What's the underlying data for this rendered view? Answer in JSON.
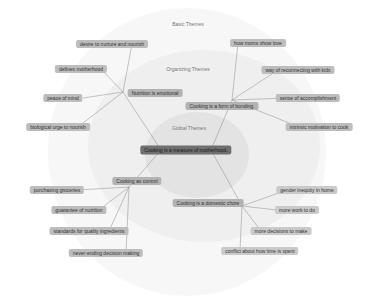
{
  "rings": {
    "basic_label": "Basic Themes",
    "organizing_label": "Organizing Themes",
    "global_label": "Global Themes"
  },
  "global_theme": {
    "label": "Cooking is a measure of motherhood.",
    "x": 186,
    "y": 150
  },
  "organizing_themes": [
    {
      "label": "Nutrition is emotional",
      "x": 155,
      "y": 93
    },
    {
      "label": "Cooking is a form of bonding.",
      "x": 222,
      "y": 106
    },
    {
      "label": "Cooking as control",
      "x": 137,
      "y": 181
    },
    {
      "label": "Cooking is a domestic chore",
      "x": 208,
      "y": 203
    }
  ],
  "basic_themes": [
    {
      "label": "desire to nurture and nourish",
      "x": 112,
      "y": 44,
      "parent": 0
    },
    {
      "label": "defines motherhood",
      "x": 81,
      "y": 69,
      "parent": 0
    },
    {
      "label": "peace of mind",
      "x": 63,
      "y": 98,
      "parent": 0
    },
    {
      "label": "biological urge to nourish",
      "x": 58,
      "y": 127,
      "parent": 0
    },
    {
      "label": "how moms show love",
      "x": 258,
      "y": 43,
      "parent": 1
    },
    {
      "label": "way of reconnecting with kids",
      "x": 298,
      "y": 70,
      "parent": 1
    },
    {
      "label": "sense of accomplishment",
      "x": 308,
      "y": 98,
      "parent": 1
    },
    {
      "label": "intrinsic motivation to cook",
      "x": 319,
      "y": 127,
      "parent": 1
    },
    {
      "label": "purchasing groceries",
      "x": 57,
      "y": 190,
      "parent": 2
    },
    {
      "label": "guarantee of nutrition",
      "x": 79,
      "y": 210,
      "parent": 2
    },
    {
      "label": "standards for quality ingredients",
      "x": 89,
      "y": 231,
      "parent": 2
    },
    {
      "label": "never-ending decision making",
      "x": 106,
      "y": 253,
      "parent": 2
    },
    {
      "label": "gender inequity in home",
      "x": 307,
      "y": 190,
      "parent": 3
    },
    {
      "label": "more work to do",
      "x": 297,
      "y": 210,
      "parent": 3
    },
    {
      "label": "more decisions to make",
      "x": 281,
      "y": 231,
      "parent": 3
    },
    {
      "label": "conflict about how time is spent",
      "x": 260,
      "y": 251,
      "parent": 3
    }
  ]
}
